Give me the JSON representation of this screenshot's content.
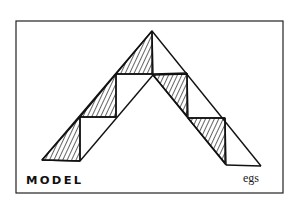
{
  "figure": {
    "caption": "MODEL",
    "signature": "egs",
    "frame": {
      "x": 16,
      "y": 21,
      "width": 267,
      "height": 172
    },
    "colors": {
      "ink": "#111111",
      "paper": "#ffffff"
    }
  }
}
